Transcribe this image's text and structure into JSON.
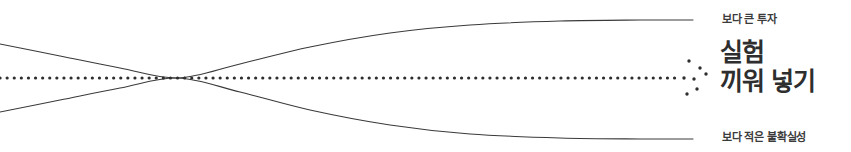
{
  "diagram": {
    "title_block": {
      "headline_line1": "실험",
      "headline_line2": "끼워 넣기"
    },
    "annotations": {
      "top_label": "보다 큰 투자",
      "bottom_label": "보다 적은 불확실성"
    },
    "colors": {
      "curve": "#3a3a3a",
      "dotted": "#2e2e2e",
      "headline_text": "#2e2e2e",
      "label_text": "#3b3b3b",
      "background": "#ffffff"
    }
  },
  "chart_data": {
    "type": "line",
    "title": "실험 끼워 넣기",
    "xlabel": "",
    "ylabel": "",
    "grid": false,
    "legend_position": "right",
    "xlim": [
      0,
      851
    ],
    "ylim": [
      152,
      0
    ],
    "annotations": [
      {
        "text": "보다 큰 투자",
        "x": 722,
        "y": 20
      },
      {
        "text": "보다 적은 불확실성",
        "x": 722,
        "y": 138
      },
      {
        "text": "실험",
        "x": 720,
        "y": 52
      },
      {
        "text": "끼워 넣기",
        "x": 720,
        "y": 81
      }
    ],
    "series": [
      {
        "name": "upper-uncertainty-bound",
        "style": "solid",
        "points": [
          [
            0,
            44
          ],
          [
            60,
            56
          ],
          [
            120,
            68
          ],
          [
            178,
            78
          ],
          [
            240,
            64
          ],
          [
            310,
            47
          ],
          [
            390,
            33
          ],
          [
            470,
            25
          ],
          [
            560,
            21
          ],
          [
            640,
            20
          ],
          [
            693,
            20
          ]
        ]
      },
      {
        "name": "lower-uncertainty-bound",
        "style": "solid",
        "points": [
          [
            0,
            112
          ],
          [
            60,
            100
          ],
          [
            120,
            88
          ],
          [
            178,
            78
          ],
          [
            240,
            92
          ],
          [
            310,
            110
          ],
          [
            390,
            125
          ],
          [
            470,
            134
          ],
          [
            560,
            138
          ],
          [
            640,
            139
          ],
          [
            693,
            139
          ]
        ]
      },
      {
        "name": "baseline-trajectory",
        "style": "dotted",
        "points": [
          [
            0,
            78
          ],
          [
            680,
            78
          ]
        ]
      }
    ],
    "scatter": {
      "name": "experiment-cluster",
      "points": [
        [
          689,
          61
        ],
        [
          700,
          68
        ],
        [
          684,
          78
        ],
        [
          694,
          79
        ],
        [
          706,
          74
        ],
        [
          697,
          89
        ],
        [
          687,
          94
        ]
      ],
      "marker_size": 3
    }
  }
}
